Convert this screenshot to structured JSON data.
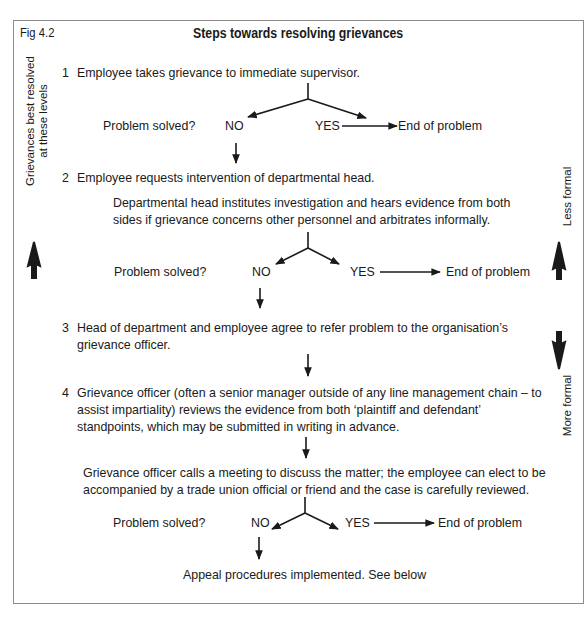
{
  "figure": {
    "label": "Fig 4.2",
    "title": "Steps towards resolving grievances"
  },
  "side_labels": {
    "left": {
      "line1": "Grievances best resolved",
      "line2": "at these levels"
    },
    "right_top": "Less formal",
    "right_bottom": "More formal"
  },
  "steps": [
    {
      "number": "1",
      "lines": [
        "Employee takes grievance to immediate supervisor."
      ]
    },
    {
      "number": "2",
      "lines": [
        "Employee requests intervention of departmental head."
      ],
      "detail": [
        "Departmental head institutes investigation and hears evidence from both",
        "sides if grievance concerns other personnel and arbitrates informally."
      ]
    },
    {
      "number": "3",
      "lines": [
        "Head of department and employee agree to refer problem to the organisation’s",
        "grievance officer."
      ]
    },
    {
      "number": "4",
      "lines": [
        "Grievance officer (often a senior manager outside of any line management chain – to",
        "assist impartiality) reviews the evidence from both ‘plaintiff and defendant’",
        "standpoints, which may be submitted in writing in advance."
      ],
      "detail": [
        "Grievance officer calls a meeting to discuss the matter; the employee can elect to be",
        "accompanied by a trade union official or friend and the case is carefully reviewed."
      ]
    }
  ],
  "decisions": [
    {
      "question": "Problem solved?",
      "no": "NO",
      "yes": "YES",
      "outcome": "End of problem"
    },
    {
      "question": "Problem solved?",
      "no": "NO",
      "yes": "YES",
      "outcome": "End of problem"
    },
    {
      "question": "Problem solved?",
      "no": "NO",
      "yes": "YES",
      "outcome": "End of problem"
    }
  ],
  "final": "Appeal procedures implemented.  See below",
  "colors": {
    "ink": "#1a1a1a",
    "frame": "#8c8c8c"
  }
}
